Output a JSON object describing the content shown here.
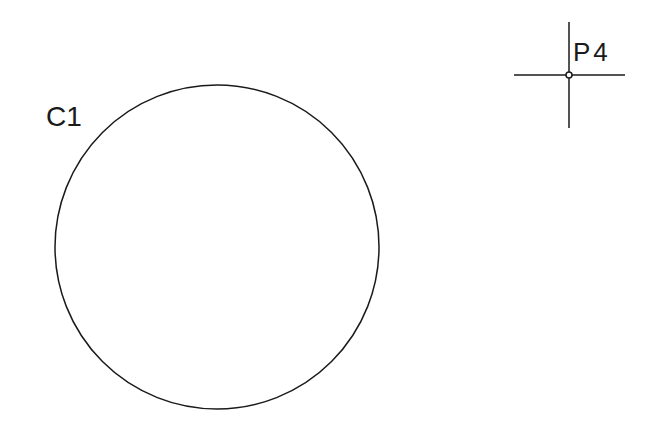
{
  "diagram": {
    "background": "#ffffff",
    "stroke_color": "#1a1a1a",
    "circle": {
      "label": "C1",
      "center": [
        217,
        247
      ],
      "radius": 162,
      "label_pos": [
        46,
        126
      ]
    },
    "point": {
      "label": "P4",
      "center": [
        569,
        75
      ],
      "arm_horizontal": [
        514,
        625
      ],
      "arm_vertical": [
        22,
        128
      ],
      "label_pos": [
        573,
        61
      ]
    }
  }
}
